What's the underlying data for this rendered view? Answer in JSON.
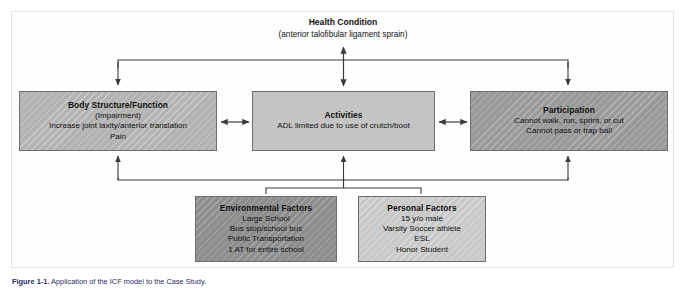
{
  "figure": {
    "caption_label": "Figure 1-1.",
    "caption_text": "Application of the ICF model to the Case Study."
  },
  "health_condition": {
    "title": "Health Condition",
    "subtitle": "(anterior talofibular ligament sprain)"
  },
  "nodes": [
    {
      "id": "body-structure",
      "title": "Body Structure/Function",
      "lines": [
        "(Impairment)",
        "Increase joint laxity/anterior translation",
        "Pain"
      ],
      "fill": "#b3b3b3",
      "pattern": "diagonal-hatch"
    },
    {
      "id": "activities",
      "title": "Activities",
      "lines": [
        "ADL limited due to use of crutch/boot"
      ],
      "fill": "#c4c4c4",
      "pattern": "flat"
    },
    {
      "id": "participation",
      "title": "Participation",
      "lines": [
        "Cannot walk, run, sprint, or cut",
        "Cannot pass or trap ball"
      ],
      "fill": "#9a9a9a",
      "pattern": "diagonal-hatch"
    },
    {
      "id": "environmental-factors",
      "title": "Environmental Factors",
      "lines": [
        "Large School",
        "Bus stop/school bus",
        "Public Transportation",
        "1 AT for entire school"
      ],
      "fill": "#8e8e8e",
      "pattern": "diagonal-hatch"
    },
    {
      "id": "personal-factors",
      "title": "Personal Factors",
      "lines": [
        "15 y/o male",
        "Varsity Soccer athlete",
        "ESL",
        "Honor Student"
      ],
      "fill": "#c9c9c9",
      "pattern": "diagonal-hatch"
    }
  ],
  "connectors": {
    "stroke_color": "#3a3a3a",
    "items": [
      {
        "name": "health-to-body-structure",
        "type": "single-arrow-down"
      },
      {
        "name": "health-to-activities",
        "type": "double-arrow-vertical"
      },
      {
        "name": "health-to-participation",
        "type": "single-arrow-down"
      },
      {
        "name": "body-structure-to-activities",
        "type": "double-arrow-horizontal"
      },
      {
        "name": "activities-to-participation",
        "type": "double-arrow-horizontal"
      },
      {
        "name": "environmental-to-body-structure",
        "type": "single-arrow-up"
      },
      {
        "name": "environmental-to-activities",
        "type": "single-arrow-up"
      },
      {
        "name": "environmental-to-participation",
        "type": "single-arrow-up"
      }
    ]
  }
}
